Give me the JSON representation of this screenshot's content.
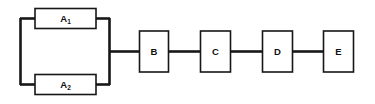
{
  "diagram": {
    "type": "block-diagram",
    "title": "",
    "background_color": "#ffffff",
    "line_color": "#171717",
    "blocks": [
      {
        "id": "A1",
        "label": "A",
        "subscript": "1",
        "arrangement": "parallel",
        "branch": "upper"
      },
      {
        "id": "A2",
        "label": "A",
        "subscript": "2",
        "arrangement": "parallel",
        "branch": "lower"
      },
      {
        "id": "B",
        "label": "B",
        "subscript": "",
        "arrangement": "series",
        "branch": ""
      },
      {
        "id": "C",
        "label": "C",
        "subscript": "",
        "arrangement": "series",
        "branch": ""
      },
      {
        "id": "D",
        "label": "D",
        "subscript": "",
        "arrangement": "series",
        "branch": ""
      },
      {
        "id": "E",
        "label": "E",
        "subscript": "",
        "arrangement": "series",
        "branch": ""
      }
    ],
    "connections": [
      {
        "from": "input-bus",
        "to": "A1"
      },
      {
        "from": "input-bus",
        "to": "A2"
      },
      {
        "from": "A1",
        "to": "output-bus"
      },
      {
        "from": "A2",
        "to": "output-bus"
      },
      {
        "from": "output-bus",
        "to": "B"
      },
      {
        "from": "B",
        "to": "C"
      },
      {
        "from": "C",
        "to": "D"
      },
      {
        "from": "D",
        "to": "E"
      }
    ]
  }
}
